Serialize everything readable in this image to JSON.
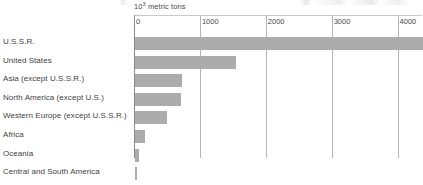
{
  "chart_data": {
    "type": "bar",
    "orientation": "horizontal",
    "title": "",
    "subtitle": "",
    "xlabel": "10³ metric tons",
    "unit_label_base": "10",
    "unit_label_exponent": "3",
    "unit_label_rest": " metric tons",
    "ylabel": "",
    "categories": [
      "U.S.S.R.",
      "United States",
      "Asia (except U.S.S.R.)",
      "North America (except U.S.)",
      "Western Europe (except U.S.S.R.)",
      "Africa",
      "Oceania",
      "Central and South America"
    ],
    "values": [
      4400,
      1530,
      710,
      700,
      490,
      150,
      60,
      35
    ],
    "value_clipped_flags": [
      true,
      false,
      false,
      false,
      false,
      false,
      false,
      false
    ],
    "xlim": [
      0,
      4370
    ],
    "tick_values": [
      0,
      1000,
      2000,
      3000,
      4000
    ],
    "tick_labels": [
      "0",
      "1000",
      "2000",
      "3000",
      "4000"
    ],
    "grid": "vertical",
    "legend": "none",
    "bar_color": "#acacac",
    "gridline_color": "#b4b4b4",
    "axis_color": "#8a8a8a",
    "text_color": "#3f3f3f",
    "background_color": "#ffffff"
  },
  "figure": {
    "name": "world-production-horizontal-bar-chart"
  }
}
